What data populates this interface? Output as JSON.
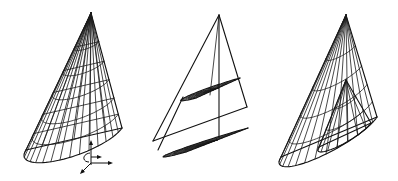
{
  "figure": {
    "background": "#ffffff",
    "line_color": "#1a1a1a",
    "panels": [
      {
        "id": "cone-1",
        "label": "",
        "style": "half-cone wireframe with meridian and latitude lines",
        "has_axes_icon": true
      },
      {
        "id": "cone-2",
        "label": "",
        "style": "half-cone outline with two semicircular polar-grid cross sections",
        "has_axes_icon": false
      },
      {
        "id": "cone-3",
        "label": "",
        "style": "half-cone wireframe with nested inner half-cone",
        "has_axes_icon": false
      }
    ],
    "axes_icon": {
      "arrows": [
        "up",
        "right",
        "down-left"
      ],
      "rotation_arc": true
    }
  }
}
